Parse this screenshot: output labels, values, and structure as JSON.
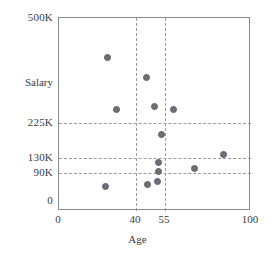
{
  "chart_data": {
    "type": "scatter",
    "title": "",
    "xlabel": "Age",
    "ylabel": "Salary",
    "xlim": [
      0,
      100
    ],
    "ylim": [
      0,
      500
    ],
    "y_unit": "K",
    "grid": true,
    "legend": "none",
    "x_ticks": [
      {
        "label": "0",
        "value": 0
      },
      {
        "label": "40",
        "value": 40
      },
      {
        "label": "55",
        "value": 55
      },
      {
        "label": "100",
        "value": 100
      }
    ],
    "y_ticks": [
      {
        "label": "500K",
        "value": 500
      },
      {
        "label": "225K",
        "value": 225
      },
      {
        "label": "130K",
        "value": 130
      },
      {
        "label": "90K",
        "value": 90
      },
      {
        "label": "0",
        "value": 0
      }
    ],
    "x_gridlines": [
      40,
      55
    ],
    "y_gridlines": [
      225,
      130,
      90
    ],
    "point_color": "#6e6e78",
    "axis_color": "#8a8a8a",
    "grid_color": "#9a9a9a",
    "points": [
      {
        "age": 30,
        "salary": 400,
        "px": 106,
        "py": 56
      },
      {
        "age": 44,
        "salary": 355,
        "px": 145,
        "py": 76
      },
      {
        "age": 34,
        "salary": 290,
        "px": 115,
        "py": 108
      },
      {
        "age": 49,
        "salary": 297,
        "px": 153,
        "py": 105
      },
      {
        "age": 59,
        "salary": 290,
        "px": 172,
        "py": 108
      },
      {
        "age": 53,
        "salary": 208,
        "px": 160,
        "py": 133
      },
      {
        "age": 85,
        "salary": 137,
        "px": 222,
        "py": 153
      },
      {
        "age": 51,
        "salary": 115,
        "px": 157,
        "py": 161
      },
      {
        "age": 70,
        "salary": 97,
        "px": 193,
        "py": 167
      },
      {
        "age": 51,
        "salary": 93,
        "px": 157,
        "py": 170
      },
      {
        "age": 51,
        "salary": 70,
        "px": 156,
        "py": 180
      },
      {
        "age": 46,
        "salary": 62,
        "px": 146,
        "py": 183
      },
      {
        "age": 24,
        "salary": 58,
        "px": 104,
        "py": 185
      }
    ]
  }
}
